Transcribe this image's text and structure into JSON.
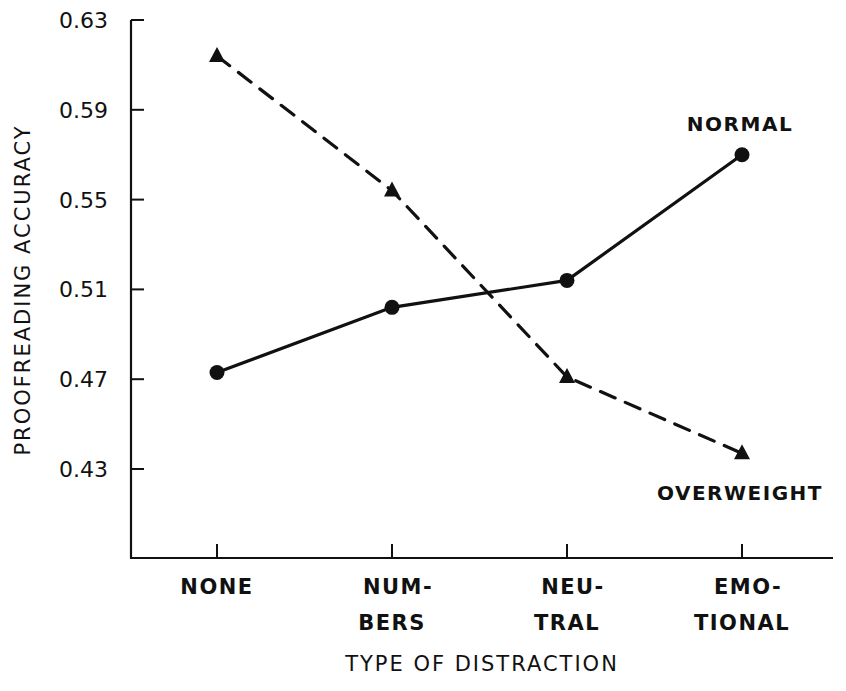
{
  "chart_data": {
    "type": "line",
    "title": "",
    "xlabel": "TYPE OF DISTRACTION",
    "ylabel": "PROOFREADING ACCURACY",
    "categories": [
      "NONE",
      "NUMBERS",
      "NEUTRAL",
      "EMOTIONAL"
    ],
    "category_labels": [
      [
        "NONE"
      ],
      [
        "NUM-",
        "BERS"
      ],
      [
        "NEU-",
        "TRAL"
      ],
      [
        "EMO-",
        "TIONAL"
      ]
    ],
    "yticks": [
      0.43,
      0.47,
      0.51,
      0.55,
      0.59,
      0.63
    ],
    "ytick_labels": [
      "0.43",
      "0.47",
      "0.51",
      "0.55",
      "0.59",
      "0.63"
    ],
    "ylim": [
      0.39,
      0.63
    ],
    "grid": false,
    "legend": "inline labels",
    "series": [
      {
        "name": "NORMAL",
        "marker": "circle",
        "line_style": "solid",
        "values": [
          0.473,
          0.502,
          0.514,
          0.57
        ]
      },
      {
        "name": "OVERWEIGHT",
        "marker": "triangle",
        "line_style": "dashed",
        "values": [
          0.614,
          0.554,
          0.471,
          0.437
        ]
      }
    ],
    "annotations": [
      {
        "text": "NORMAL",
        "near": "EMOTIONAL",
        "position": "above"
      },
      {
        "text": "OVERWEIGHT",
        "near": "EMOTIONAL",
        "position": "below"
      }
    ]
  },
  "colors": {
    "ink": "#111111",
    "background": "#ffffff"
  }
}
